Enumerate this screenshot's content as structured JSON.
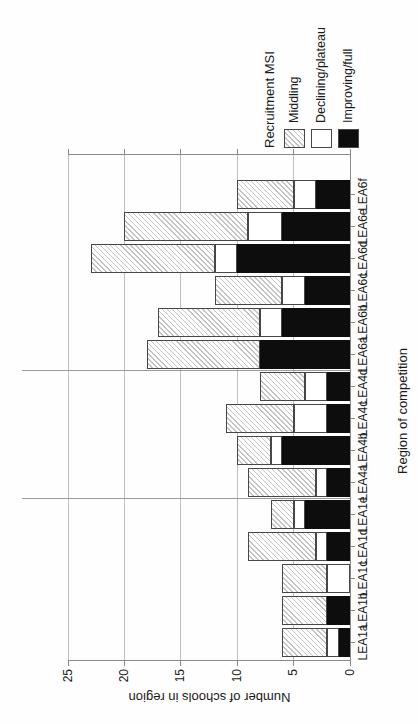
{
  "chart_data": {
    "type": "bar",
    "stacked": true,
    "title": "",
    "xlabel": "Region of competition",
    "ylabel": "Number of schools in region",
    "legend_title": "Recruitment MSI",
    "legend_position": "right of plot",
    "grid": true,
    "yticks": [
      0,
      5,
      10,
      15,
      20,
      25
    ],
    "ylim": [
      0,
      25
    ],
    "layout_hint": "landscape chart rotated 90 degrees counter-clockwise on portrait page; bars stacked bottom-to-top: Improving/full, Declining/plateau, Middling",
    "categories": [
      "LEA1a",
      "LEA1b",
      "LEA1c",
      "LEA1d",
      "LEA1e",
      "LEA4a",
      "LEA4b",
      "LEA4c",
      "LEA4d",
      "LEA6a",
      "LEA6b",
      "LEA6c",
      "LEA6d",
      "LEA6e",
      "LEA6f"
    ],
    "group_separators_after": [
      "LEA1e",
      "LEA4d"
    ],
    "series": [
      {
        "name": "Middling",
        "style": "middling",
        "pattern": "diagonal-hatch",
        "values": [
          4,
          4,
          4,
          6,
          2,
          6,
          3,
          6,
          4,
          10,
          9,
          6,
          11,
          11,
          5
        ]
      },
      {
        "name": "Declining/plateau",
        "style": "declining",
        "pattern": "solid-white",
        "values": [
          1,
          0,
          2,
          1,
          1,
          1,
          1,
          3,
          2,
          0,
          2,
          2,
          2,
          3,
          2
        ]
      },
      {
        "name": "Improving/full",
        "style": "improving",
        "pattern": "solid-black",
        "values": [
          1,
          2,
          0,
          2,
          4,
          2,
          6,
          2,
          2,
          8,
          6,
          4,
          10,
          6,
          3
        ]
      }
    ],
    "totals": [
      6,
      6,
      6,
      9,
      7,
      9,
      10,
      11,
      8,
      18,
      17,
      12,
      23,
      20,
      10
    ],
    "colors": {
      "improving_full": "#0d0d0d",
      "declining_plateau": "#ffffff",
      "middling_hatch_line": "#c3c3c3",
      "axis_line": "#8a8a8a",
      "gridline": "#bfbfbf",
      "group_separator": "#9a9a9a"
    }
  }
}
